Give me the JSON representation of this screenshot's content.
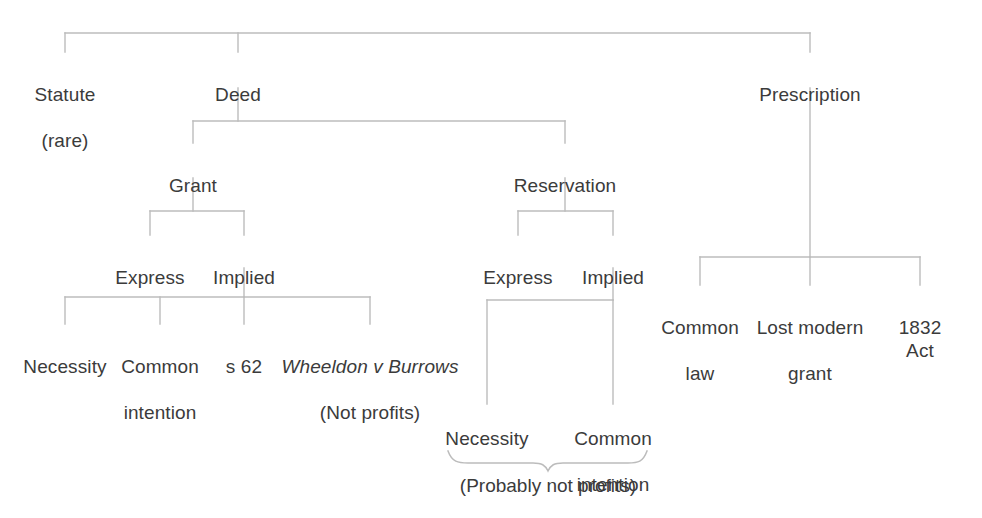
{
  "diagram": {
    "type": "tree",
    "line_color": "#b9b9b9",
    "text_color": "#3b3b3b",
    "background": "#ffffff",
    "nodes": {
      "statute": {
        "label": "Statute",
        "sub": "(rare)"
      },
      "deed": {
        "label": "Deed"
      },
      "prescription": {
        "label": "Prescription"
      },
      "grant": {
        "label": "Grant"
      },
      "reservation": {
        "label": "Reservation"
      },
      "grant_express": {
        "label": "Express"
      },
      "grant_implied": {
        "label": "Implied"
      },
      "res_express": {
        "label": "Express"
      },
      "res_implied": {
        "label": "Implied"
      },
      "grant_necessity": {
        "label": "Necessity"
      },
      "grant_common_intention": {
        "label": "Common",
        "sub": "intention"
      },
      "grant_s62": {
        "label": "s 62"
      },
      "grant_wheeldon": {
        "case": "Wheeldon v Burrows",
        "sub": "(Not profits)"
      },
      "res_necessity": {
        "label": "Necessity"
      },
      "res_common_intention": {
        "label": "Common",
        "sub": "intention"
      },
      "presc_common_law": {
        "label": "Common",
        "sub": "law"
      },
      "presc_lost_modern_grant": {
        "label": "Lost modern",
        "sub": "grant"
      },
      "presc_1832_act": {
        "label": "1832 Act"
      }
    },
    "annotations": {
      "res_brace_note": "(Probably not profits)"
    }
  }
}
